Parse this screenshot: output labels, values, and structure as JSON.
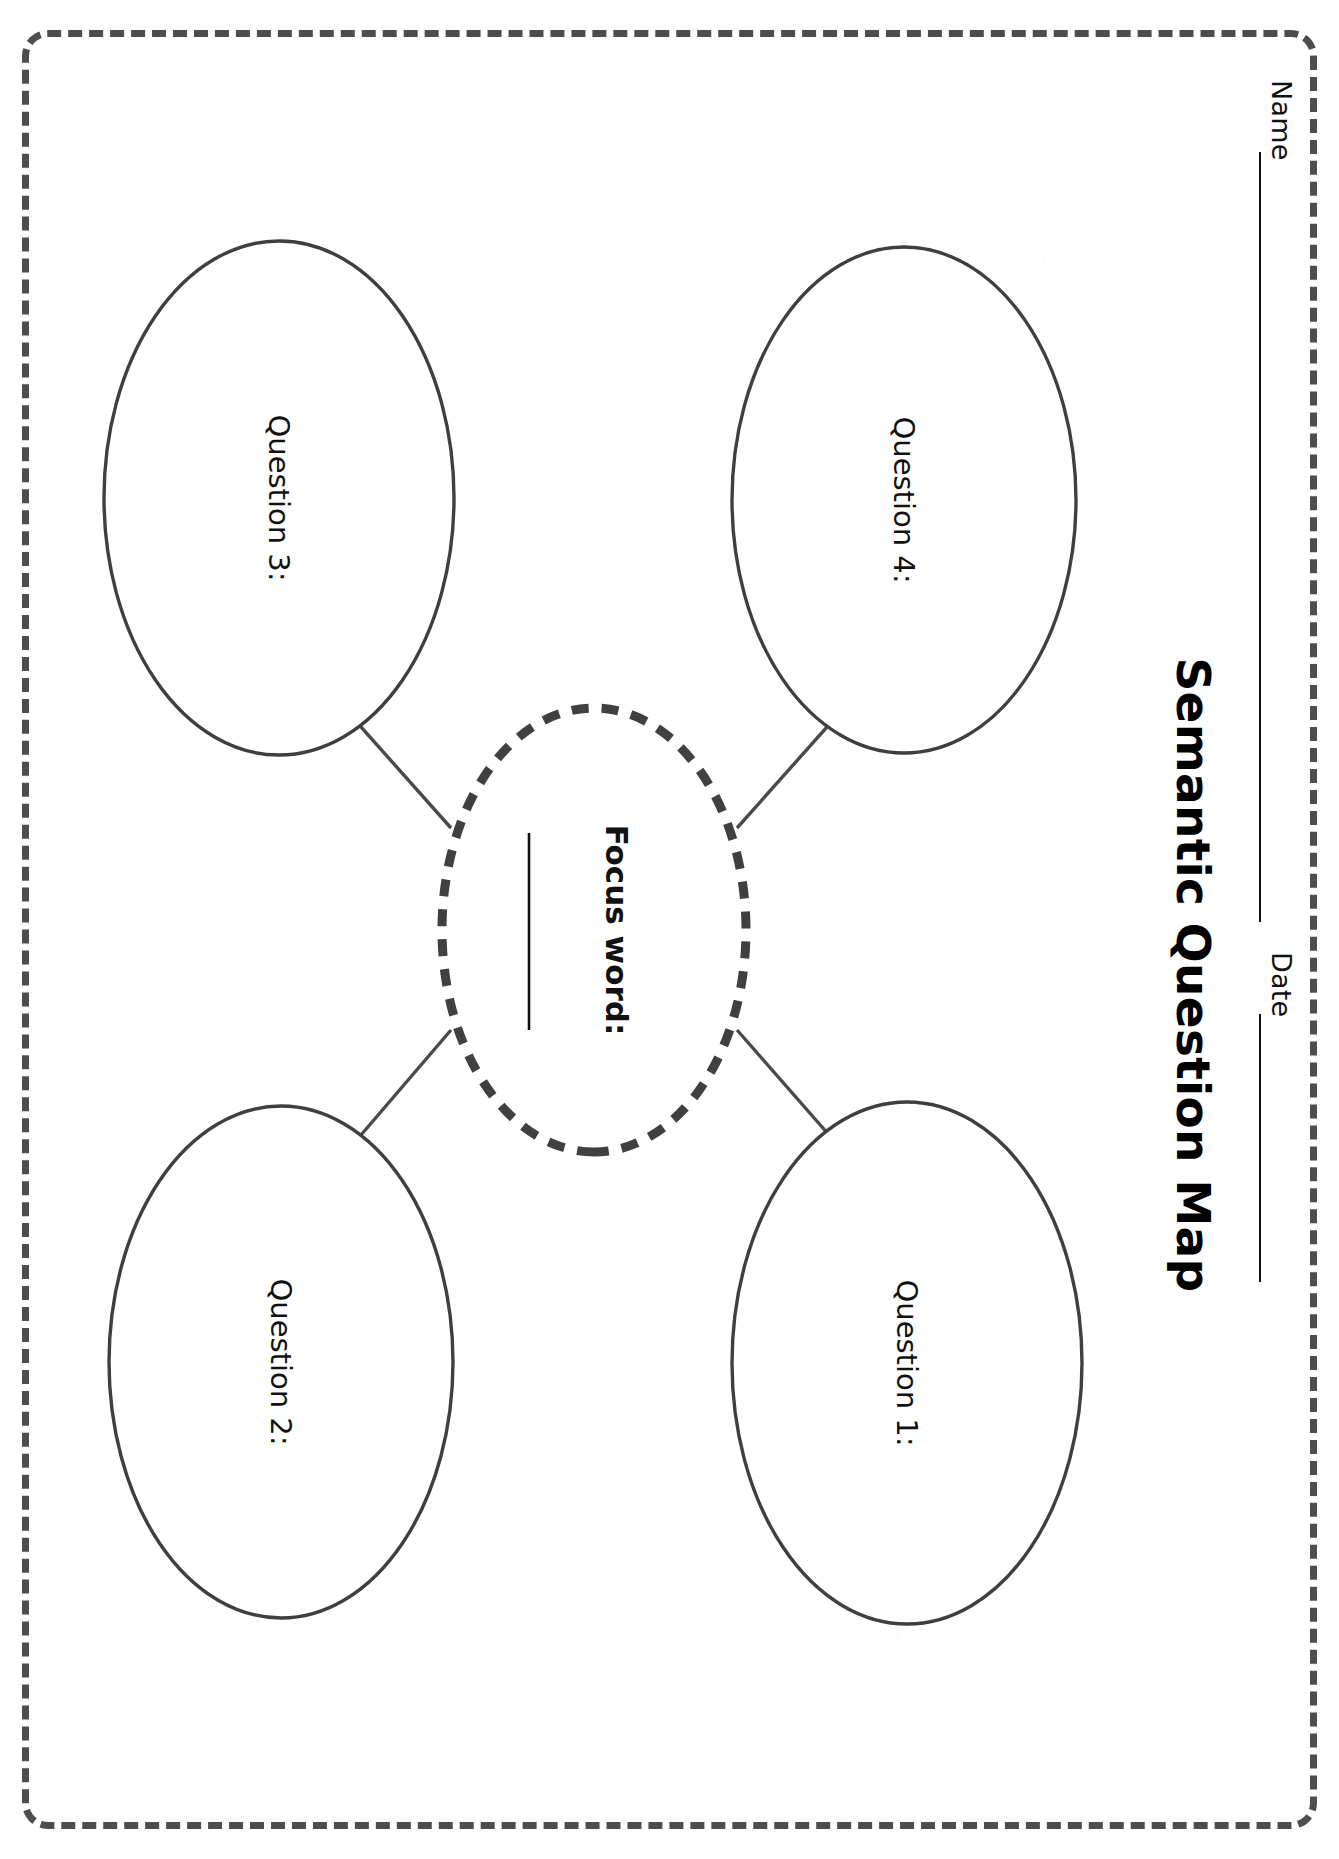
{
  "document": {
    "title": "Semantic Question Map",
    "type": "graphic-organizer-worksheet",
    "orientation": "rotated-90-clockwise"
  },
  "header": {
    "name_label": "Name",
    "name_value": "",
    "date_label": "Date",
    "date_value": "",
    "title": "Semantic Question Map"
  },
  "center_node": {
    "label": "Focus word:",
    "value": "",
    "border_style": "thick-dashed",
    "border_color": "#404040"
  },
  "question_nodes": [
    {
      "id": "q1",
      "label": "Question 1:",
      "value": "",
      "position": "top-right"
    },
    {
      "id": "q2",
      "label": "Question 2:",
      "value": "",
      "position": "bottom-right"
    },
    {
      "id": "q3",
      "label": "Question 3:",
      "value": "",
      "position": "bottom-left"
    },
    {
      "id": "q4",
      "label": "Question 4:",
      "value": "",
      "position": "top-left"
    }
  ],
  "colors": {
    "page_border": "#4d4d4d",
    "ellipse_stroke": "#3f3f3f",
    "connector_stroke": "#4a4a4a",
    "ink": "#111111",
    "paper": "#ffffff"
  }
}
